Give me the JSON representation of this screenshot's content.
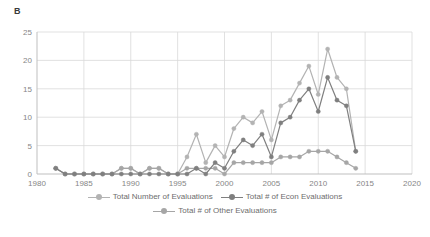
{
  "panel": {
    "label": "B"
  },
  "colors": {
    "total": "#b3b3b3",
    "econ": "#7f7f7f",
    "other": "#a6a6a6",
    "grid": "#d9d9d9",
    "axis": "#bfbfbf",
    "text": "#868686"
  },
  "legend": {
    "position": "bottom",
    "rows": [
      [
        {
          "label": "Total Number of Evaluations",
          "color": "#b3b3b3",
          "marker": "circle-line"
        },
        {
          "label": "Total # of Econ Evaluations",
          "color": "#7f7f7f",
          "marker": "circle-line"
        }
      ],
      [
        {
          "label": "Total # of Other Evaluations",
          "color": "#a6a6a6",
          "marker": "circle-line"
        }
      ]
    ]
  },
  "chart_data": {
    "type": "line",
    "title": "B",
    "xlabel": "",
    "ylabel": "",
    "xlim": [
      1980,
      2020
    ],
    "ylim": [
      0,
      25
    ],
    "xticks": [
      1980,
      1985,
      1990,
      1995,
      2000,
      2005,
      2010,
      2015,
      2020
    ],
    "yticks": [
      0,
      5,
      10,
      15,
      20,
      25
    ],
    "grid": true,
    "x": [
      1982,
      1983,
      1984,
      1985,
      1986,
      1987,
      1988,
      1989,
      1990,
      1991,
      1992,
      1993,
      1994,
      1995,
      1996,
      1997,
      1998,
      1999,
      2000,
      2001,
      2002,
      2003,
      2004,
      2005,
      2006,
      2007,
      2008,
      2009,
      2010,
      2011,
      2012,
      2013,
      2014
    ],
    "series": [
      {
        "name": "Total Number of Evaluations",
        "color": "#b3b3b3",
        "values": [
          1,
          0,
          0,
          0,
          0,
          0,
          0,
          1,
          1,
          0,
          1,
          1,
          0,
          0,
          3,
          7,
          2,
          5,
          3,
          8,
          10,
          9,
          11,
          6,
          12,
          13,
          16,
          19,
          14,
          22,
          17,
          15,
          4
        ]
      },
      {
        "name": "Total # of Econ Evaluations",
        "color": "#7f7f7f",
        "values": [
          1,
          0,
          0,
          0,
          0,
          0,
          0,
          0,
          0,
          0,
          0,
          0,
          0,
          0,
          0,
          1,
          0,
          2,
          1,
          4,
          6,
          5,
          7,
          3,
          9,
          10,
          13,
          15,
          11,
          17,
          13,
          12,
          4
        ]
      },
      {
        "name": "Total # of Other Evaluations",
        "color": "#a6a6a6",
        "values": [
          1,
          0,
          0,
          0,
          0,
          0,
          0,
          1,
          1,
          0,
          1,
          1,
          0,
          0,
          1,
          1,
          1,
          1,
          0,
          2,
          2,
          2,
          2,
          2,
          3,
          3,
          3,
          4,
          4,
          4,
          3,
          2,
          1
        ]
      }
    ]
  }
}
